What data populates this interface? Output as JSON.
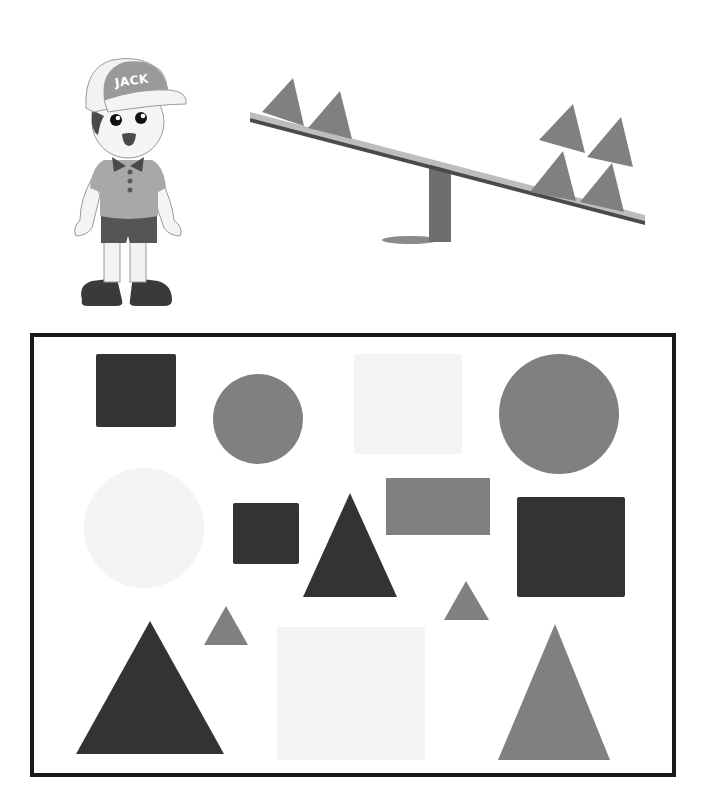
{
  "character": {
    "name": "Jack",
    "cap_label": "JACK"
  },
  "colors": {
    "dark": "#333333",
    "medium": "#808080",
    "light": "#f4f4f4",
    "border": "#1a1a1a",
    "plank": "#bdbdbd",
    "plank_edge": "#4a4a4a",
    "post": "#6e6e6e"
  },
  "seesaw": {
    "left_side": {
      "shape": "triangle",
      "count": 2,
      "color": "medium"
    },
    "right_side": {
      "shape": "triangle",
      "count": 4,
      "color": "medium"
    },
    "tilt": "right side down"
  },
  "shapes_box": {
    "shapes": [
      {
        "id": 1,
        "type": "square",
        "color": "dark",
        "size": "medium"
      },
      {
        "id": 2,
        "type": "circle",
        "color": "medium",
        "size": "medium"
      },
      {
        "id": 3,
        "type": "square",
        "color": "light",
        "size": "large"
      },
      {
        "id": 4,
        "type": "circle",
        "color": "medium",
        "size": "large"
      },
      {
        "id": 5,
        "type": "circle",
        "color": "light",
        "size": "large"
      },
      {
        "id": 6,
        "type": "square",
        "color": "dark",
        "size": "small"
      },
      {
        "id": 7,
        "type": "triangle",
        "color": "dark",
        "size": "medium"
      },
      {
        "id": 8,
        "type": "rectangle",
        "color": "medium",
        "size": "medium"
      },
      {
        "id": 9,
        "type": "square",
        "color": "dark",
        "size": "large"
      },
      {
        "id": 10,
        "type": "triangle",
        "color": "medium",
        "size": "small"
      },
      {
        "id": 11,
        "type": "triangle",
        "color": "medium",
        "size": "small"
      },
      {
        "id": 12,
        "type": "triangle",
        "color": "dark",
        "size": "large"
      },
      {
        "id": 13,
        "type": "square",
        "color": "light",
        "size": "large"
      },
      {
        "id": 14,
        "type": "triangle",
        "color": "medium",
        "size": "large"
      }
    ]
  }
}
